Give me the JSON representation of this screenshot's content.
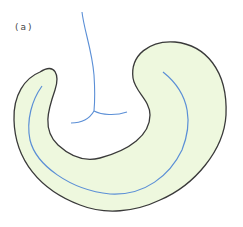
{
  "figure": {
    "panel_label": "(a)",
    "colors": {
      "region_fill": "#eef8de",
      "region_outline": "#3a3a3a",
      "channel_line": "#5b8fd6",
      "background": "#ffffff"
    },
    "elements": [
      {
        "name": "outer-region",
        "description": "curved kidney/hook-shaped filled region with dark outline"
      },
      {
        "name": "inner-channel-line",
        "description": "blue centerline running along the curved region"
      },
      {
        "name": "branching-line",
        "description": "blue vertical line descending from top and splitting into two branches"
      }
    ]
  }
}
